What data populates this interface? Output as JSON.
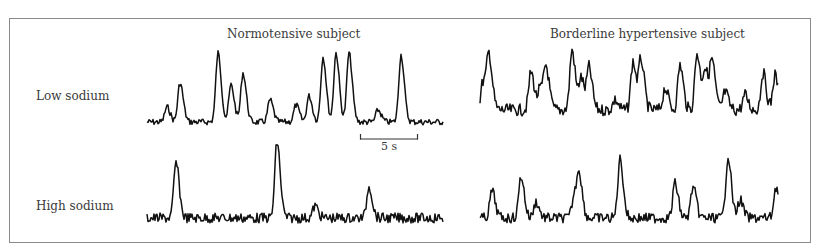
{
  "figure": {
    "column_titles": [
      "Normotensive subject",
      "Borderline hypertensive subject"
    ],
    "row_labels": [
      "Low sodium",
      "High sodium"
    ],
    "scale_bar": {
      "label": "5 s",
      "seconds": 5
    }
  },
  "chart_data": {
    "type": "line",
    "title": "",
    "xlabel": "Time",
    "ylabel": "Signal (arbitrary units)",
    "grid": false,
    "legend": null,
    "scale_bar": "5 s",
    "layout": "2x2 grid: rows = sodium intake, columns = subject group",
    "panels": [
      {
        "row": "Low sodium",
        "column": "Normotensive subject",
        "x_range": [
          147,
          443
        ],
        "baseline": 122,
        "peaks": [
          [
            167,
            107
          ],
          [
            180,
            83
          ],
          [
            218,
            53
          ],
          [
            231,
            85
          ],
          [
            243,
            73
          ],
          [
            270,
            100
          ],
          [
            296,
            105
          ],
          [
            309,
            96
          ],
          [
            323,
            57
          ],
          [
            336,
            53
          ],
          [
            349,
            53
          ],
          [
            378,
            110
          ],
          [
            401,
            55
          ]
        ],
        "noise": 3
      },
      {
        "row": "Low sodium",
        "column": "Borderline hypertensive subject",
        "x_range": [
          480,
          778
        ],
        "baseline": 110,
        "peaks": [
          [
            483,
            82
          ],
          [
            489,
            57
          ],
          [
            531,
            72
          ],
          [
            540,
            90
          ],
          [
            546,
            68
          ],
          [
            572,
            50
          ],
          [
            581,
            78
          ],
          [
            589,
            68
          ],
          [
            615,
            100
          ],
          [
            633,
            62
          ],
          [
            641,
            60
          ],
          [
            665,
            88
          ],
          [
            680,
            65
          ],
          [
            697,
            53
          ],
          [
            705,
            70
          ],
          [
            712,
            62
          ],
          [
            725,
            92
          ],
          [
            745,
            95
          ],
          [
            763,
            73
          ],
          [
            775,
            75
          ]
        ],
        "noise": 6
      },
      {
        "row": "High sodium",
        "column": "Normotensive subject",
        "x_range": [
          147,
          443
        ],
        "baseline": 218,
        "peaks": [
          [
            176,
            163
          ],
          [
            277,
            142
          ],
          [
            369,
            186
          ],
          [
            315,
            206
          ]
        ],
        "noise": 5
      },
      {
        "row": "High sodium",
        "column": "Borderline hypertensive subject",
        "x_range": [
          480,
          778
        ],
        "baseline": 218,
        "peaks": [
          [
            492,
            191
          ],
          [
            521,
            176
          ],
          [
            536,
            202
          ],
          [
            574,
            197
          ],
          [
            579,
            175
          ],
          [
            620,
            159
          ],
          [
            675,
            183
          ],
          [
            693,
            187
          ],
          [
            728,
            156
          ],
          [
            740,
            200
          ],
          [
            776,
            187
          ]
        ],
        "noise": 5
      }
    ]
  }
}
